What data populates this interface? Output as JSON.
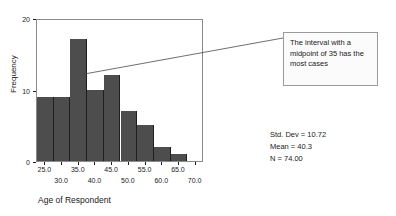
{
  "chart_data": {
    "type": "bar",
    "title": "",
    "xlabel": "Age of Respondent",
    "ylabel": "Frequency",
    "categories": [
      25,
      30,
      35,
      40,
      45,
      50,
      55,
      60,
      65
    ],
    "values": [
      9,
      9,
      17,
      10,
      12,
      7,
      5,
      2,
      1
    ],
    "bin_width": 5,
    "xlim": [
      22.5,
      72.5
    ],
    "ylim": [
      0,
      20
    ],
    "xticks": [
      "25.0",
      "30.0",
      "35.0",
      "40.0",
      "45.0",
      "50.0",
      "55.0",
      "60.0",
      "65.0",
      "70.0"
    ],
    "xtick_values": [
      25,
      30,
      35,
      40,
      45,
      50,
      55,
      60,
      65,
      70
    ],
    "yticks": [
      "0",
      "10",
      "20"
    ],
    "ytick_values": [
      0,
      10,
      20
    ],
    "grid": false,
    "legend": null,
    "bar_color": "#4d4d4d",
    "frame_color": "#8a8a8a",
    "annotations": [
      {
        "text": "The interval with a midpoint of 35 has the most cases",
        "points_to_category": 35
      }
    ],
    "stats": [
      "Std. Dev = 10.72",
      "Mean = 40.3",
      "N = 74.00"
    ]
  }
}
